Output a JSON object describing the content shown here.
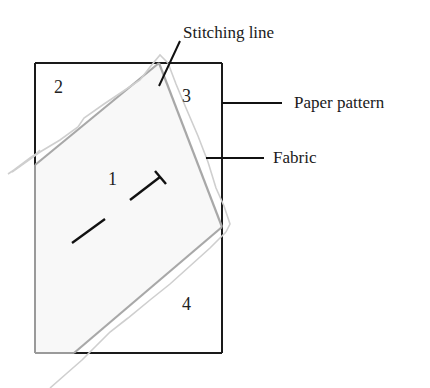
{
  "diagram": {
    "title_fragment": "",
    "callouts": {
      "stitching_line": "Stitching line",
      "paper_pattern": "Paper pattern",
      "fabric": "Fabric"
    },
    "section_numbers": [
      "1",
      "2",
      "3",
      "4"
    ],
    "colors": {
      "pattern_outline": "#1a1a1a",
      "fabric_outline": "#a8a8a8",
      "fabric_raw_edge": "#cfcfcf",
      "fabric_fill": "#f7f7f7",
      "grain_line": "#111111"
    }
  }
}
